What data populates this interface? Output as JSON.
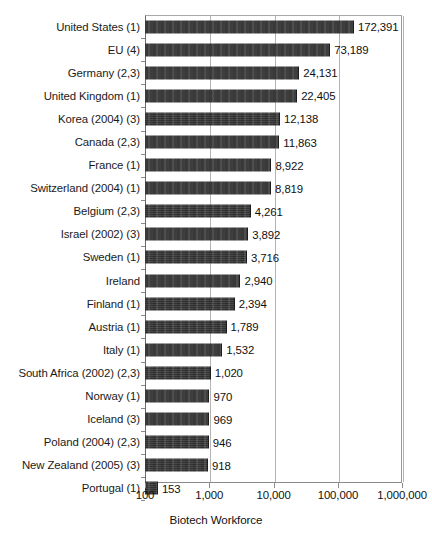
{
  "chart_data": {
    "type": "bar",
    "orientation": "horizontal",
    "title": "",
    "xlabel": "Biotech Workforce",
    "ylabel": "",
    "xscale": "log",
    "xlim": [
      100,
      1000000
    ],
    "xticks": [
      100,
      1000,
      10000,
      100000,
      1000000
    ],
    "xticklabels": [
      "100",
      "1,000",
      "10,000",
      "100,000",
      "1,000,000"
    ],
    "grid": true,
    "grid_axis": "x",
    "legend": false,
    "bar_color": "#333333",
    "categories": [
      "United States (1)",
      "EU (4)",
      "Germany (2,3)",
      "United Kingdom (1)",
      "Korea (2004) (3)",
      "Canada (2,3)",
      "France (1)",
      "Switzerland (2004) (1)",
      "Belgium (2,3)",
      "Israel (2002) (3)",
      "Sweden (1)",
      "Ireland",
      "Finland (1)",
      "Austria (1)",
      "Italy (1)",
      "South Africa (2002) (2,3)",
      "Norway (1)",
      "Iceland (3)",
      "Poland (2004) (2,3)",
      "New Zealand (2005) (3)",
      "Portugal (1)"
    ],
    "values": [
      172391,
      73189,
      24131,
      22405,
      12138,
      11863,
      8922,
      8819,
      4261,
      3892,
      3716,
      2940,
      2394,
      1789,
      1532,
      1020,
      970,
      969,
      946,
      918,
      153
    ],
    "value_labels": [
      "172,391",
      "73,189",
      "24,131",
      "22,405",
      "12,138",
      "11,863",
      "8,922",
      "8,819",
      "4,261",
      "3,892",
      "3,716",
      "2,940",
      "2,394",
      "1,789",
      "1,532",
      "1,020",
      "970",
      "969",
      "946",
      "918",
      "153"
    ]
  }
}
